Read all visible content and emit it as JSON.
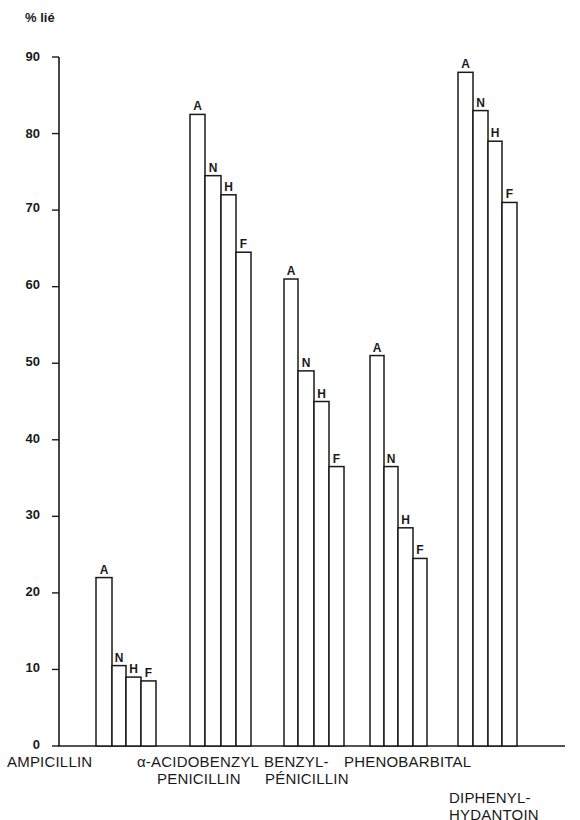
{
  "chart_data": {
    "type": "bar",
    "title": "",
    "ylabel": "% lié",
    "xlabel": "",
    "ylim": [
      0,
      90
    ],
    "yticks": [
      0,
      10,
      20,
      30,
      40,
      50,
      60,
      70,
      80,
      90
    ],
    "grid": false,
    "legend": null,
    "bar_labels": [
      "A",
      "N",
      "H",
      "F"
    ],
    "categories": [
      "AMPICILLIN",
      "α-ACIDOBENZYL PENICILLIN",
      "BENZYL-PÉNICILLIN",
      "PHENOBARBITAL",
      "DIPHENYL-HYDANTOIN"
    ],
    "series": [
      {
        "name": "A",
        "values": [
          22,
          82.5,
          61,
          51,
          88
        ]
      },
      {
        "name": "N",
        "values": [
          10.5,
          74.5,
          49,
          36.5,
          83
        ]
      },
      {
        "name": "H",
        "values": [
          9,
          72,
          45,
          28.5,
          79
        ]
      },
      {
        "name": "F",
        "values": [
          8.5,
          64.5,
          36.5,
          24.5,
          71
        ]
      }
    ]
  },
  "axis": {
    "y_title": "% lié",
    "ticks": [
      "0",
      "10",
      "20",
      "30",
      "40",
      "50",
      "60",
      "70",
      "80",
      "90"
    ]
  },
  "labels": {
    "ampicillin": "AMPICILLIN",
    "acido_line1": "α-ACIDOBENZYL",
    "acido_line2": "PENICILLIN",
    "benzyl_line1": "BENZYL-",
    "benzyl_line2": "PÉNICILLIN",
    "pheno": "PHENOBARBITAL",
    "diphenyl_line1": "DIPHENYL-",
    "diphenyl_line2": "HYDANTOIN"
  },
  "colors": {
    "ink": "#1a1a1a",
    "bar_fill": "#ffffff",
    "background": "#ffffff"
  }
}
